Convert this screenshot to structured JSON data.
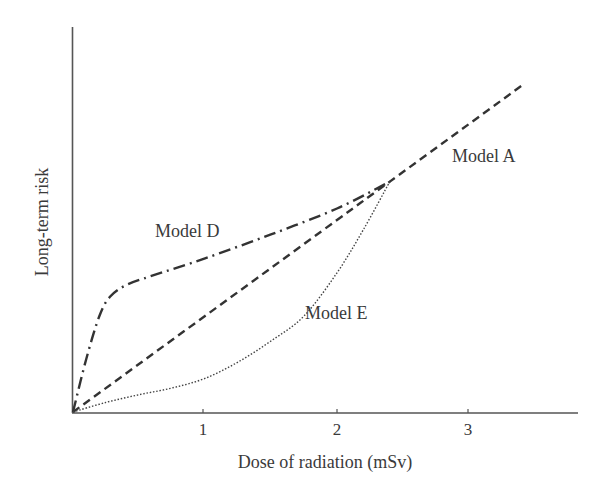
{
  "chart_data": {
    "type": "line",
    "title": "",
    "xlabel": "Dose of radiation (mSv)",
    "ylabel": "Long-term risk",
    "xlim": [
      0,
      3.8
    ],
    "ylim": [
      0,
      4.0
    ],
    "x_ticks": [
      1,
      2,
      3
    ],
    "x_tick_labels": [
      "1",
      "2",
      "3"
    ],
    "y_ticks": [],
    "grid": false,
    "legend": "inline labels",
    "series": [
      {
        "name": "Model A",
        "style": "dashed",
        "x": [
          0,
          0.5,
          1.0,
          1.5,
          2.0,
          2.4,
          3.0,
          3.42
        ],
        "y": [
          0,
          0.5,
          1.0,
          1.5,
          2.0,
          2.4,
          3.0,
          3.42
        ]
      },
      {
        "name": "Model D",
        "style": "dash-dot",
        "x": [
          0,
          0.1,
          0.2,
          0.28,
          0.4,
          0.6,
          1.0,
          1.5,
          2.0,
          2.4
        ],
        "y": [
          0,
          0.55,
          1.0,
          1.2,
          1.32,
          1.42,
          1.6,
          1.85,
          2.12,
          2.4
        ]
      },
      {
        "name": "Model E",
        "style": "dotted",
        "x": [
          0,
          0.25,
          0.5,
          0.75,
          1.0,
          1.25,
          1.5,
          1.75,
          2.0,
          2.2,
          2.4
        ],
        "y": [
          0,
          0.1,
          0.18,
          0.25,
          0.35,
          0.52,
          0.74,
          1.0,
          1.45,
          1.9,
          2.4
        ]
      }
    ],
    "annotations": [
      {
        "text": "Model A",
        "x": 2.9,
        "y": 3.1
      },
      {
        "text": "Model D",
        "x": 0.65,
        "y": 1.9
      },
      {
        "text": "Model E",
        "x": 1.75,
        "y": 1.05
      }
    ]
  },
  "labels": {
    "xlabel": "Dose of radiation (mSv)",
    "ylabel": "Long-term risk",
    "model_a": "Model A",
    "model_d": "Model D",
    "model_e": "Model E",
    "tick_1": "1",
    "tick_2": "2",
    "tick_3": "3"
  }
}
